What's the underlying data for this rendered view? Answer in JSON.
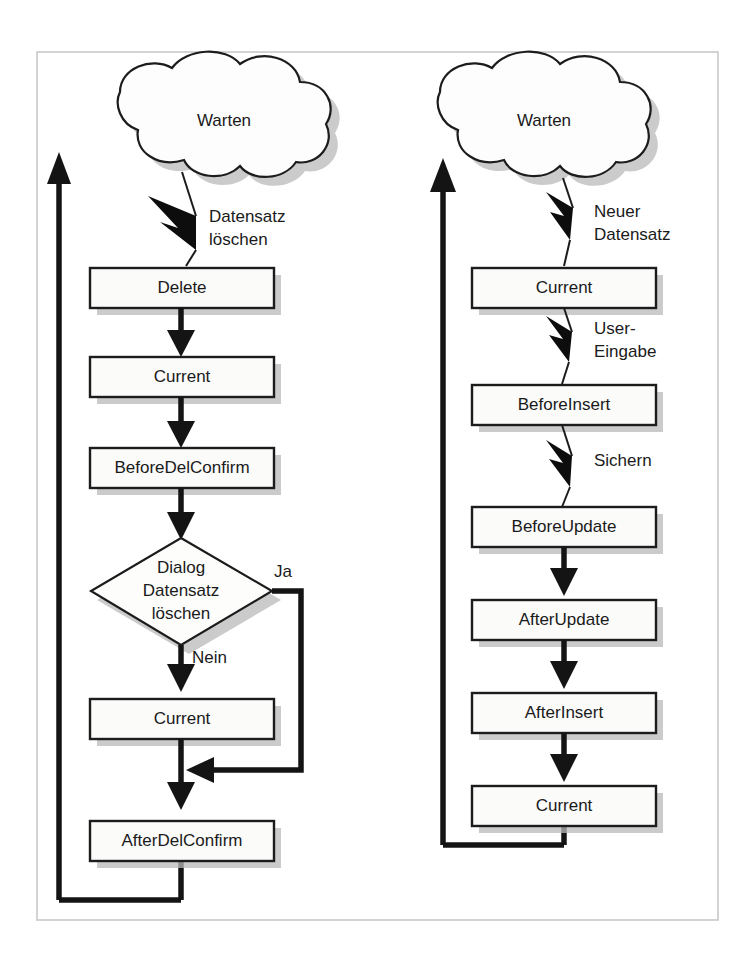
{
  "figure": {
    "frame": {
      "x": 37,
      "y": 52,
      "width": 681,
      "height": 868
    }
  },
  "left_flow": {
    "name": "delete-flow",
    "start_cloud": "Warten",
    "end_cloud": "Warten",
    "nodes": [
      {
        "id": "delete",
        "label": "Delete",
        "shape": "process"
      },
      {
        "id": "current1",
        "label": "Current",
        "shape": "process"
      },
      {
        "id": "beforedelconfirm",
        "label": "BeforeDelConfirm",
        "shape": "process"
      },
      {
        "id": "dialog",
        "label": "Dialog Datensatz löschen",
        "label_lines": [
          "Dialog",
          "Datensatz",
          "löschen"
        ],
        "shape": "decision"
      },
      {
        "id": "current2",
        "label": "Current",
        "shape": "process"
      },
      {
        "id": "afterdelconfirm",
        "label": "AfterDelConfirm",
        "shape": "process"
      }
    ],
    "edge_labels": {
      "trigger": "Datensatz löschen",
      "trigger_lines": [
        "Datensatz",
        "löschen"
      ],
      "yes": "Ja",
      "no": "Nein"
    }
  },
  "right_flow": {
    "name": "insert-flow",
    "start_cloud": "Warten",
    "nodes": [
      {
        "id": "current1",
        "label": "Current",
        "shape": "process"
      },
      {
        "id": "beforeinsert",
        "label": "BeforeInsert",
        "shape": "process"
      },
      {
        "id": "beforeupdate",
        "label": "BeforeUpdate",
        "shape": "process"
      },
      {
        "id": "afterupdate",
        "label": "AfterUpdate",
        "shape": "process"
      },
      {
        "id": "afterinsert",
        "label": "AfterInsert",
        "shape": "process"
      },
      {
        "id": "current2",
        "label": "Current",
        "shape": "process"
      }
    ],
    "edge_labels": {
      "trigger1": "Neuer Datensatz",
      "trigger1_lines": [
        "Neuer",
        "Datensatz"
      ],
      "trigger2": "User-Eingabe",
      "trigger2_lines": [
        "User-",
        "Eingabe"
      ],
      "trigger3": "Sichern",
      "trigger3_lines": [
        "Sichern"
      ]
    }
  },
  "colors": {
    "ink": "#141414",
    "box_fill": "#fbfbfa",
    "shadow": "#b9b9b9",
    "frame": "#c9c9c9",
    "page": "#ffffff"
  }
}
